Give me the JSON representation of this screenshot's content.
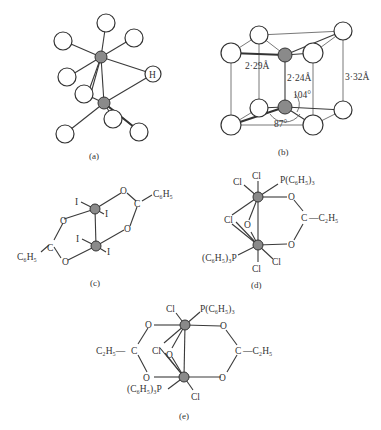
{
  "figure": {
    "panels": [
      {
        "id": "a",
        "caption": "(a)",
        "atoms": {
          "H_label": "H"
        }
      },
      {
        "id": "b",
        "caption": "(b)",
        "labels": {
          "dist_1": "2·29Å",
          "dist_2": "2·24Å",
          "dist_3": "3·32Å",
          "angle_1": "104°",
          "angle_2": "87°"
        }
      },
      {
        "id": "c",
        "caption": "(c)",
        "labels": {
          "I": "I",
          "O": "O",
          "C": "C",
          "C6H5": "C₆H₅"
        }
      },
      {
        "id": "d",
        "caption": "(d)",
        "labels": {
          "Cl": "Cl",
          "O": "O",
          "C": "C",
          "C2H5": "—C₂H₅",
          "PPh3_right": "P(C₆H₅)₃",
          "PPh3_left": "(C₆H₅)₃P"
        }
      },
      {
        "id": "e",
        "caption": "(e)",
        "labels": {
          "Cl": "Cl",
          "O": "O",
          "C": "C",
          "C2H5_left": "C₂H₅—",
          "C2H5_right": "—C₂H₅",
          "PPh3_right": "P(C₆H₅)₃",
          "PPh3_left": "(C₆H₅)₃P"
        }
      }
    ]
  }
}
